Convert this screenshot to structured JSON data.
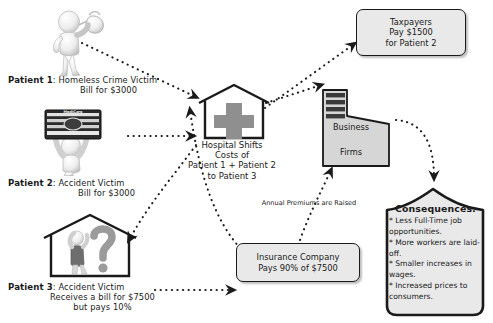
{
  "diagram": {
    "title_strip": "",
    "patients": [
      {
        "id": "patient-1",
        "who": "Patient 1",
        "desc": ": Homeless Crime Victim",
        "line2": "Bill for $3000",
        "figure": "homeless-person-with-bindle-icon"
      },
      {
        "id": "patient-2",
        "who": "Patient 2",
        "desc": ": Accident Victim",
        "line2": "Bill for $3000",
        "figure": "person-holding-medicare-card-icon",
        "card_text": "MediCare"
      },
      {
        "id": "patient-3",
        "who": "Patient 3",
        "desc": ": Accident Victim",
        "line2": "Receives a bill for $7500",
        "line3": "but pays 10%",
        "figure": "person-in-house-with-question-mark-icon"
      }
    ],
    "hospital": {
      "icon": "hospital-house-with-cross-icon",
      "label_lines": [
        "Hospital Shifts",
        "Costs of",
        "Patient 1 + Patient 2",
        "to Patient 3"
      ]
    },
    "taxpayers_box": {
      "lines": [
        "Taxpayers",
        "Pay $1500",
        "for Patient 2"
      ]
    },
    "insurance_box": {
      "lines": [
        "Insurance Company",
        "Pays 90% of $7500"
      ]
    },
    "business_firms": {
      "icon": "office-building-icon",
      "line1": "Business",
      "line2": "Firms"
    },
    "premium_label": "Annual Premiums are Raised",
    "consequences": {
      "title": "Consequences:",
      "items": [
        "* Less Full-Time job opportunities.",
        "* More workers are laid-off.",
        "* Smaller increases in wages.",
        "* Increased prices to consumers."
      ]
    },
    "arrows": [
      {
        "name": "patient-1-to-hospital",
        "from": "patient-1",
        "to": "hospital"
      },
      {
        "name": "patient-2-to-hospital",
        "from": "patient-2",
        "to": "hospital"
      },
      {
        "name": "hospital-to-taxpayers",
        "from": "hospital",
        "to": "taxpayers-box"
      },
      {
        "name": "hospital-to-business-firms",
        "from": "hospital",
        "to": "business-firms"
      },
      {
        "name": "hospital-to-patient-3",
        "from": "hospital",
        "to": "patient-3"
      },
      {
        "name": "patient-3-to-insurance",
        "from": "patient-3",
        "to": "insurance-box"
      },
      {
        "name": "insurance-to-hospital",
        "from": "insurance-box",
        "to": "hospital"
      },
      {
        "name": "insurance-to-business-firms",
        "from": "insurance-box",
        "to": "business-firms"
      },
      {
        "name": "business-firms-to-consequences",
        "from": "business-firms",
        "to": "consequences"
      }
    ],
    "colors": {
      "ink": "#1a1a1a",
      "box_fill": "#e9e9e9",
      "cross_gray": "#8f8f8f",
      "building_gray": "#d6d6d6",
      "building_dark": "#3a3a3a"
    }
  }
}
